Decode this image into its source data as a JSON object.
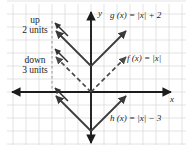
{
  "figure": {
    "background_color": "#ffffff",
    "grid_color": "#d9d9d9",
    "axis_color": "#1c1c1c",
    "curve_color": "#3a3a3a",
    "dashed_color": "#4a4a4a"
  },
  "axes": {
    "x_label": "x",
    "y_label": "y",
    "origin_px": {
      "x": 91,
      "y": 92
    },
    "unit_px": 13,
    "x_range": [
      -6.4,
      7.5
    ],
    "y_range": [
      -4.1,
      6.8
    ],
    "grid": true
  },
  "annotations": [
    {
      "name": "up-annotation",
      "line1": "up",
      "line2": "2 units",
      "x_px": 10,
      "y_px": 16
    },
    {
      "name": "down-annotation",
      "line1": "down",
      "line2": "3 units",
      "x_px": 8,
      "y_px": 56
    }
  ],
  "functions": [
    {
      "name": "g",
      "label": "g (x) = |x| + 2",
      "expression": "|x| + 2",
      "vertex": [
        0,
        2
      ],
      "shift": 2,
      "style": "solid",
      "label_x_px": 110,
      "label_y_px": 11
    },
    {
      "name": "f",
      "label": "f (x) = |x|",
      "expression": "|x|",
      "vertex": [
        0,
        0
      ],
      "shift": 0,
      "style": "dashed",
      "label_x_px": 127,
      "label_y_px": 54
    },
    {
      "name": "h",
      "label": "h (x) = |x| − 3",
      "expression": "|x| - 3",
      "vertex": [
        0,
        -3
      ],
      "shift": -3,
      "style": "solid",
      "label_x_px": 110,
      "label_y_px": 114
    }
  ],
  "guide": {
    "name": "vertical-guide",
    "x_px": 52,
    "y_top_px": 21,
    "y_bottom_px": 91,
    "style": "dashed"
  }
}
